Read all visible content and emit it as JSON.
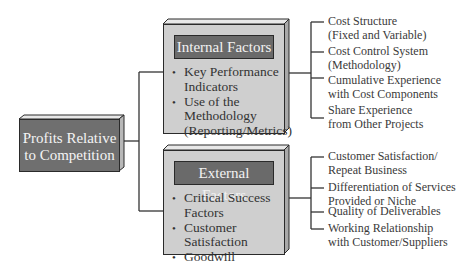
{
  "root": {
    "label_line1": "Profits Relative",
    "label_line2": "to Competition"
  },
  "internal": {
    "title": "Internal Factors",
    "bullets": [
      {
        "line1": "Key Performance",
        "line2": "Indicators"
      },
      {
        "line1": "Use of the",
        "line2": "Methodology",
        "line3": "(Reporting/Metrics)"
      }
    ],
    "leaves": [
      {
        "line1": "Cost Structure",
        "line2": "(Fixed and Variable)"
      },
      {
        "line1": "Cost Control System",
        "line2": "(Methodology)"
      },
      {
        "line1": "Cumulative Experience",
        "line2": "with Cost Components"
      },
      {
        "line1": "Share Experience",
        "line2": "from Other Projects"
      }
    ]
  },
  "external": {
    "title": "External Factors",
    "bullets": [
      {
        "line1": "Critical Success",
        "line2": "Factors"
      },
      {
        "line1": "Customer",
        "line2": "Satisfaction"
      },
      {
        "line1": "Goodwill"
      }
    ],
    "leaves": [
      {
        "line1": "Customer Satisfaction/",
        "line2": "Repeat Business"
      },
      {
        "line1": "Differentiation of Services",
        "line2": "Provided or Niche"
      },
      {
        "line1": "Quality of Deliverables"
      },
      {
        "line1": "Working Relationship",
        "line2": "with Customer/Suppliers"
      }
    ]
  },
  "colors": {
    "root_fill": "#6f6f6f",
    "panel_fill": "#cfcfcf",
    "header_fill": "#6a6a6a",
    "line": "#333333"
  }
}
